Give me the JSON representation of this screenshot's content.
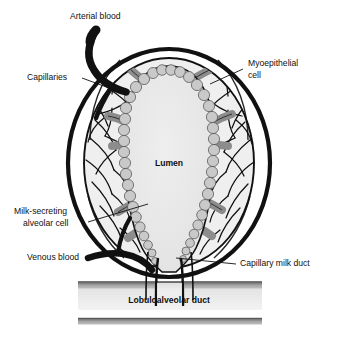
{
  "figure": {
    "background_color": "#ffffff"
  },
  "labels": {
    "arterial_blood": "Arterial blood",
    "capillaries": "Capillaries",
    "myoepithelial_cell_line1": "Myoepithelial",
    "myoepithelial_cell_line2": "cell",
    "milk_secreting_line1": "Milk-secreting",
    "milk_secreting_line2": "alveolar cell",
    "venous_blood": "Venous blood",
    "capillary_milk_duct": "Capillary milk duct",
    "lumen": "Lumen",
    "lobuloalveolar_duct": "Lobuloalveolar duct"
  },
  "colors": {
    "outline": "#111111",
    "lumen_fill": "#e9e9e9",
    "tissue_fill": "#efefef",
    "alveolar_cell_fill": "#c9c9c9",
    "myoepithelial_fill": "#8d8d8d",
    "duct_band_dark": "#6a6a6a",
    "duct_band_light": "#b4b4b4",
    "duct_interior": "#ececec",
    "label_text": "#101010",
    "background": "#ffffff"
  },
  "structures": [
    {
      "name": "arterial-vessel",
      "type": "vessel",
      "flow": "inflow"
    },
    {
      "name": "venous-vessel",
      "type": "vessel",
      "flow": "outflow"
    },
    {
      "name": "alveolus-body",
      "type": "alveolus"
    },
    {
      "name": "lumen-cavity",
      "type": "cavity"
    },
    {
      "name": "alveolar-cell-ring",
      "type": "epithelium"
    },
    {
      "name": "myoepithelial-bands",
      "type": "contractile-cells"
    },
    {
      "name": "capillary-network",
      "type": "vasculature"
    },
    {
      "name": "lobuloalveolar-duct",
      "type": "duct"
    }
  ]
}
